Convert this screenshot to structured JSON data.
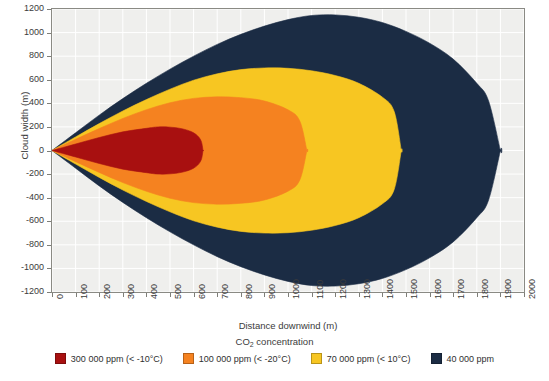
{
  "chart_data": {
    "type": "area",
    "title": "",
    "xlabel": "Distance downwind (m)",
    "ylabel": "Cloud width (m)",
    "xlim": [
      0,
      2000
    ],
    "ylim": [
      -1200,
      1200
    ],
    "grid": true,
    "legend_position": "bottom",
    "legend_title_prefix": "CO",
    "legend_title_sub": "2",
    "legend_title_suffix": " concentration",
    "xticks": [
      "0",
      "100",
      "200",
      "300",
      "400",
      "500",
      "600",
      "700",
      "800",
      "900",
      "1000",
      "1100",
      "1200",
      "1300",
      "1400",
      "1500",
      "1600",
      "1700",
      "1800",
      "1900",
      "2000"
    ],
    "yticks": [
      "1200",
      "1000",
      "800",
      "600",
      "400",
      "200",
      "0",
      "-200",
      "-400",
      "-600",
      "-800",
      "-1000",
      "-1200"
    ],
    "series": [
      {
        "name": "40 000 ppm",
        "label": "40 000 ppm",
        "color": "#1b2c44",
        "max_distance_m": 1900,
        "max_half_width_m": 1150,
        "width_at_distance": [
          [
            0,
            0
          ],
          [
            100,
            150
          ],
          [
            200,
            300
          ],
          [
            300,
            440
          ],
          [
            400,
            570
          ],
          [
            500,
            690
          ],
          [
            600,
            800
          ],
          [
            700,
            900
          ],
          [
            800,
            985
          ],
          [
            900,
            1055
          ],
          [
            1000,
            1110
          ],
          [
            1100,
            1145
          ],
          [
            1200,
            1150
          ],
          [
            1300,
            1130
          ],
          [
            1400,
            1085
          ],
          [
            1500,
            1010
          ],
          [
            1600,
            910
          ],
          [
            1700,
            775
          ],
          [
            1800,
            570
          ],
          [
            1850,
            420
          ],
          [
            1900,
            0
          ]
        ]
      },
      {
        "name": "70 000 ppm (< 10°C)",
        "label": "70 000 ppm (< 10°C)",
        "color": "#f7c622",
        "max_distance_m": 1480,
        "max_half_width_m": 700,
        "width_at_distance": [
          [
            0,
            0
          ],
          [
            100,
            115
          ],
          [
            200,
            228
          ],
          [
            300,
            335
          ],
          [
            400,
            432
          ],
          [
            500,
            520
          ],
          [
            600,
            596
          ],
          [
            700,
            650
          ],
          [
            800,
            686
          ],
          [
            900,
            700
          ],
          [
            1000,
            697
          ],
          [
            1100,
            676
          ],
          [
            1200,
            636
          ],
          [
            1300,
            570
          ],
          [
            1400,
            452
          ],
          [
            1450,
            330
          ],
          [
            1480,
            0
          ]
        ]
      },
      {
        "name": "100 000 ppm (< -20°C)",
        "label": "100 000 ppm (< -20°C)",
        "color": "#f58220",
        "max_distance_m": 1080,
        "max_half_width_m": 455,
        "width_at_distance": [
          [
            0,
            0
          ],
          [
            100,
            95
          ],
          [
            200,
            186
          ],
          [
            300,
            272
          ],
          [
            400,
            346
          ],
          [
            500,
            405
          ],
          [
            600,
            442
          ],
          [
            700,
            455
          ],
          [
            800,
            448
          ],
          [
            900,
            420
          ],
          [
            1000,
            345
          ],
          [
            1050,
            250
          ],
          [
            1080,
            0
          ]
        ]
      },
      {
        "name": "300 000 ppm (< -10°C)",
        "label": "300 000 ppm (< -10°C)",
        "color": "#a81010",
        "max_distance_m": 640,
        "max_half_width_m": 200,
        "width_at_distance": [
          [
            0,
            0
          ],
          [
            100,
            55
          ],
          [
            200,
            110
          ],
          [
            300,
            158
          ],
          [
            400,
            188
          ],
          [
            450,
            200
          ],
          [
            500,
            198
          ],
          [
            550,
            185
          ],
          [
            600,
            150
          ],
          [
            630,
            90
          ],
          [
            640,
            0
          ]
        ]
      }
    ]
  },
  "legend": {
    "items": [
      {
        "label": "300 000 ppm (< -10°C)",
        "color": "#a81010"
      },
      {
        "label": "100 000 ppm (< -20°C)",
        "color": "#f58220"
      },
      {
        "label": "70 000 ppm (< 10°C)",
        "color": "#f7c622"
      },
      {
        "label": "40 000 ppm",
        "color": "#1b2c44"
      }
    ]
  }
}
